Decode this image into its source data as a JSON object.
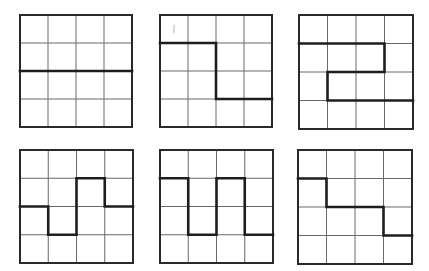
{
  "diagram": {
    "grid_size": 4,
    "colors": {
      "background": "#ffffff",
      "grid_line": "#6a6a6a",
      "border": "#2a2a2a",
      "path": "#1e1e1e"
    },
    "panels": [
      {
        "id": 1,
        "x": 20,
        "y": 15,
        "size": 112,
        "path": [
          [
            0,
            2
          ],
          [
            4,
            2
          ]
        ]
      },
      {
        "id": 2,
        "x": 160,
        "y": 15,
        "size": 112,
        "path": [
          [
            0,
            1
          ],
          [
            2,
            1
          ],
          [
            2,
            3
          ],
          [
            4,
            3
          ]
        ],
        "artifact": [
          0.5,
          0.35,
          0.5,
          0.65
        ]
      },
      {
        "id": 3,
        "x": 299,
        "y": 15,
        "size": 114,
        "path": [
          [
            0,
            1
          ],
          [
            3,
            1
          ],
          [
            3,
            2
          ],
          [
            1,
            2
          ],
          [
            1,
            3
          ],
          [
            4,
            3
          ]
        ]
      },
      {
        "id": 4,
        "x": 20,
        "y": 150,
        "size": 113,
        "path": [
          [
            0,
            2
          ],
          [
            1,
            2
          ],
          [
            1,
            3
          ],
          [
            2,
            3
          ],
          [
            2,
            1
          ],
          [
            3,
            1
          ],
          [
            3,
            2
          ],
          [
            4,
            2
          ]
        ]
      },
      {
        "id": 5,
        "x": 160,
        "y": 150,
        "size": 113,
        "path": [
          [
            0,
            1
          ],
          [
            1,
            1
          ],
          [
            1,
            3
          ],
          [
            2,
            3
          ],
          [
            2,
            1
          ],
          [
            3,
            1
          ],
          [
            3,
            3
          ],
          [
            4,
            3
          ]
        ]
      },
      {
        "id": 6,
        "x": 298,
        "y": 150,
        "size": 114,
        "path": [
          [
            0,
            1
          ],
          [
            1,
            1
          ],
          [
            1,
            2
          ],
          [
            3,
            2
          ],
          [
            3,
            3
          ],
          [
            4,
            3
          ]
        ]
      }
    ]
  }
}
